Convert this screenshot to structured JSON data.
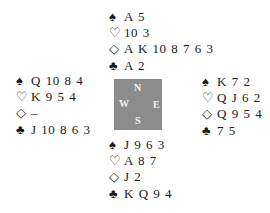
{
  "hands": {
    "north": {
      "spades": "A 5",
      "hearts": "10 3",
      "diamonds": "A K 10 8 7 6 3",
      "clubs": "A 2"
    },
    "west": {
      "spades": "Q 10 8 4",
      "hearts": "K 9 5 4",
      "diamonds": "–",
      "clubs": "J 10 8 6 3"
    },
    "east": {
      "spades": "K 7 2",
      "hearts": "Q J 6 2",
      "diamonds": "Q 9 5 4",
      "clubs": "7 5"
    },
    "south": {
      "spades": "J 9 6 3",
      "hearts": "A 8 7",
      "diamonds": "J 2",
      "clubs": "K Q 9 4"
    }
  },
  "suit_symbols": {
    "spades": "♠",
    "hearts": "♡",
    "diamonds": "◇",
    "clubs": "♣"
  },
  "compass": {
    "n": "N",
    "w": "W",
    "e": "E",
    "s": "S",
    "color": "#8c8c8c"
  }
}
